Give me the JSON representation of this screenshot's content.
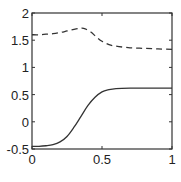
{
  "chart_data": {
    "type": "line",
    "title": "",
    "xlabel": "",
    "ylabel": "",
    "xlim": [
      0,
      1
    ],
    "ylim": [
      -0.5,
      2
    ],
    "grid": false,
    "legend": null,
    "x_ticks": [
      0,
      0.5,
      1
    ],
    "x_tick_labels": [
      "0",
      "0.5",
      "1"
    ],
    "y_ticks": [
      -0.5,
      0,
      0.5,
      1,
      1.5,
      2
    ],
    "y_tick_labels": [
      "-0.5",
      "0",
      "0.5",
      "1",
      "1.5",
      "2"
    ],
    "series": [
      {
        "name": "dashed",
        "style": "dashed",
        "color": "#333333",
        "x": [
          0,
          0.05,
          0.1,
          0.15,
          0.2,
          0.25,
          0.3,
          0.35,
          0.38,
          0.42,
          0.46,
          0.5,
          0.55,
          0.6,
          0.7,
          0.8,
          0.9,
          1.0
        ],
        "y": [
          1.6,
          1.6,
          1.61,
          1.62,
          1.64,
          1.67,
          1.7,
          1.72,
          1.71,
          1.65,
          1.56,
          1.48,
          1.42,
          1.39,
          1.36,
          1.35,
          1.34,
          1.33
        ]
      },
      {
        "name": "solid",
        "style": "solid",
        "color": "#333333",
        "x": [
          0,
          0.05,
          0.1,
          0.15,
          0.2,
          0.25,
          0.3,
          0.35,
          0.4,
          0.45,
          0.5,
          0.55,
          0.6,
          0.7,
          0.8,
          0.9,
          1.0
        ],
        "y": [
          -0.45,
          -0.45,
          -0.44,
          -0.42,
          -0.37,
          -0.27,
          -0.1,
          0.1,
          0.3,
          0.45,
          0.55,
          0.59,
          0.61,
          0.62,
          0.62,
          0.62,
          0.62
        ]
      }
    ]
  }
}
